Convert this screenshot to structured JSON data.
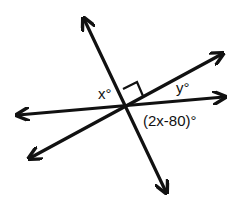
{
  "diagram": {
    "type": "intersecting-lines-angles",
    "lines": [
      {
        "name": "steep-line",
        "from": [
          82,
          15
        ],
        "to": [
          168,
          196
        ]
      },
      {
        "name": "shallow-rising-line",
        "from": [
          26,
          160
        ],
        "to": [
          226,
          52
        ]
      },
      {
        "name": "near-horizontal-line",
        "from": [
          14,
          115
        ],
        "to": [
          228,
          97
        ]
      }
    ],
    "intersection": [
      126,
      106
    ],
    "right_angle_marker": true,
    "labels": {
      "x_angle": "x°",
      "y_angle": "y°",
      "expr_angle": "(2x-80)°"
    },
    "stroke_color": "#111111"
  }
}
